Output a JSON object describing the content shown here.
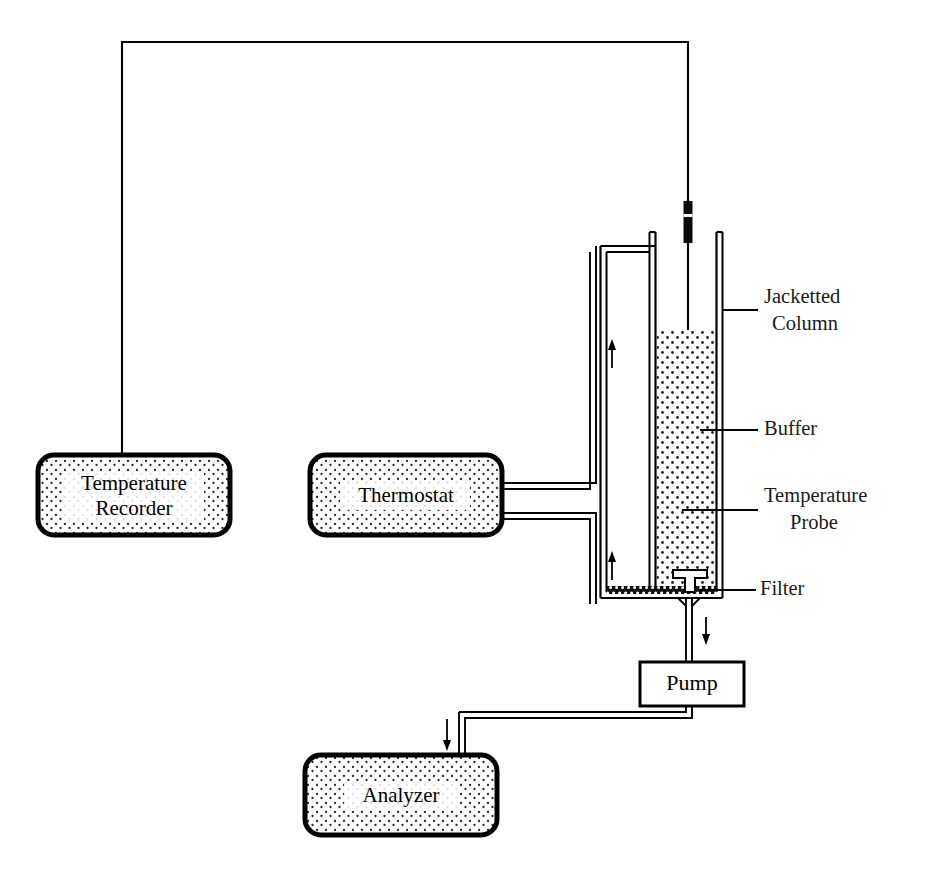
{
  "figure": {
    "background_color": "#ffffff",
    "ink_color": "#000000"
  },
  "components": {
    "temperature_recorder": {
      "label_line1": "Temperature",
      "label_line2": "Recorder",
      "shape": "rounded-rect-stippled",
      "x": 38,
      "y": 455,
      "w": 192,
      "h": 80
    },
    "thermostat": {
      "label_line1": "Thermostat",
      "label_line2": "",
      "shape": "rounded-rect-stippled",
      "x": 310,
      "y": 455,
      "w": 192,
      "h": 80
    },
    "analyzer": {
      "label_line1": "Analyzer",
      "label_line2": "",
      "shape": "rounded-rect-stippled",
      "x": 305,
      "y": 755,
      "w": 192,
      "h": 80
    },
    "pump": {
      "label_line1": "Pump",
      "label_line2": "",
      "shape": "plain-rect",
      "x": 640,
      "y": 662,
      "w": 104,
      "h": 44
    }
  },
  "annotations": [
    {
      "id": "jacketted-column",
      "line1": "Jacketted",
      "line2": "Column",
      "text_x": 764,
      "text_y": 298,
      "leader_from_x": 722,
      "leader_to_x": 758,
      "leader_y": 310
    },
    {
      "id": "buffer",
      "line1": "Buffer",
      "line2": "",
      "text_x": 764,
      "text_y": 430,
      "leader_from_x": 700,
      "leader_to_x": 758,
      "leader_y": 430
    },
    {
      "id": "temperature-probe",
      "line1": "Temperature",
      "line2": "Probe",
      "text_x": 764,
      "text_y": 497,
      "leader_from_x": 680,
      "leader_to_x": 758,
      "leader_y": 510
    },
    {
      "id": "filter",
      "line1": "Filter",
      "line2": "",
      "text_x": 762,
      "text_y": 590,
      "leader_from_x": 700,
      "leader_to_x": 758,
      "leader_y": 590
    }
  ],
  "flow_arrows": [
    {
      "id": "jacket-upper-flow",
      "direction": "up",
      "x": 612,
      "y_tail": 368,
      "y_head": 342
    },
    {
      "id": "jacket-lower-flow",
      "direction": "up",
      "x": 612,
      "y_tail": 580,
      "y_head": 554
    },
    {
      "id": "column-outlet-flow",
      "direction": "down",
      "x": 692,
      "y_tail": 614,
      "y_head": 644
    },
    {
      "id": "analyzer-inlet-flow",
      "direction": "down",
      "x": 459,
      "y_tail": 718,
      "y_head": 752
    }
  ],
  "geometry": {
    "probe_wire": {
      "top_y": 42,
      "left_x": 122,
      "right_x": 688,
      "recorder_drop_y": 455,
      "probe_bottom_y": 578
    },
    "probe_connector": {
      "x": 684,
      "y": 201,
      "w": 9,
      "h": 42
    },
    "column": {
      "inner_left": 655,
      "inner_right": 716,
      "top_y": 232,
      "frit_y": 592,
      "buffer_top_y": 330
    },
    "jacket": {
      "outer_left": 600,
      "outer_right": 722,
      "top_y": 239
    },
    "outlet_tube": {
      "x": 692,
      "from_y": 600,
      "to_y": 662
    },
    "pump_to_analyzer": {
      "down_to_y": 718,
      "left_to_x": 459,
      "analyzer_top_y": 755
    }
  },
  "colors": {
    "ink": "#000000",
    "stipple": "#2b2b2b",
    "paper": "#ffffff",
    "label_text": "#1a1a1a"
  }
}
